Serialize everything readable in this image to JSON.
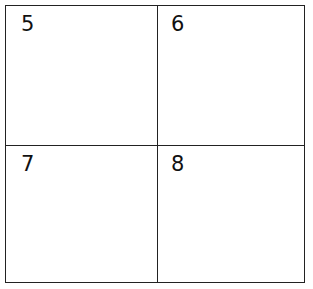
{
  "grid": {
    "cells": [
      {
        "label": "5"
      },
      {
        "label": "6"
      },
      {
        "label": "7"
      },
      {
        "label": "8"
      }
    ]
  }
}
